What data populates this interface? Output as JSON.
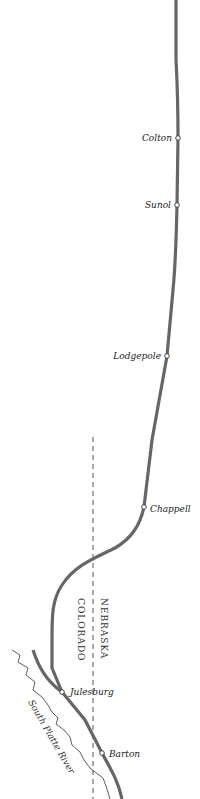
{
  "map": {
    "colors": {
      "background": "#ffffff",
      "railroad": "#6a6a6a",
      "railroad_edge": "#4a4a4a",
      "border": "#555555",
      "river": "#333333",
      "station_fill": "#ffffff",
      "station_stroke": "#444444"
    },
    "towns": [
      {
        "name": "Colton",
        "x": 178,
        "y": 138
      },
      {
        "name": "Sunol",
        "x": 177,
        "y": 205
      },
      {
        "name": "Lodgepole",
        "x": 167,
        "y": 356
      },
      {
        "name": "Chappell",
        "x": 144,
        "y": 507
      },
      {
        "name": "Julesburg",
        "x": 62,
        "y": 692
      },
      {
        "name": "Barton",
        "x": 102,
        "y": 753
      }
    ],
    "states": {
      "east": "Nebraska",
      "west": "Colorado"
    },
    "river": {
      "name": "South Platte River"
    }
  }
}
